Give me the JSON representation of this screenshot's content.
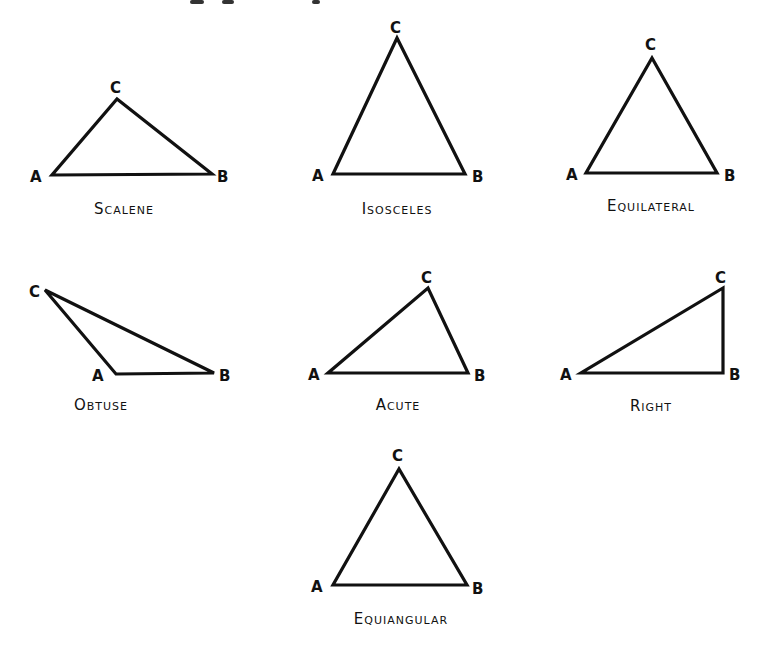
{
  "diagram": {
    "stroke_color": "#111111",
    "background": "#ffffff",
    "triangles": [
      {
        "name": "Scalene",
        "caption": "Scalene",
        "vertices": {
          "A": [
            52,
            175
          ],
          "B": [
            212,
            174
          ],
          "C": [
            117,
            99
          ]
        },
        "labels": {
          "A": "A",
          "B": "B",
          "C": "C"
        }
      },
      {
        "name": "Isosceles",
        "caption": "Isosceles",
        "vertices": {
          "A": [
            333,
            174
          ],
          "B": [
            465,
            174
          ],
          "C": [
            397,
            38
          ]
        },
        "labels": {
          "A": "A",
          "B": "B",
          "C": "C"
        }
      },
      {
        "name": "Equilateral",
        "caption": "Equilateral",
        "vertices": {
          "A": [
            586,
            173
          ],
          "B": [
            717,
            173
          ],
          "C": [
            652,
            58
          ]
        },
        "labels": {
          "A": "A",
          "B": "B",
          "C": "C"
        }
      },
      {
        "name": "Obtuse",
        "caption": "Obtuse",
        "vertices": {
          "A": [
            116,
            374
          ],
          "B": [
            214,
            373
          ],
          "C": [
            45,
            290
          ]
        },
        "labels": {
          "A": "A",
          "B": "B",
          "C": "C"
        }
      },
      {
        "name": "Acute",
        "caption": "Acute",
        "vertices": {
          "A": [
            328,
            373
          ],
          "B": [
            468,
            373
          ],
          "C": [
            428,
            288
          ]
        },
        "labels": {
          "A": "A",
          "B": "B",
          "C": "C"
        }
      },
      {
        "name": "Right",
        "caption": "Right",
        "vertices": {
          "A": [
            581,
            373
          ],
          "B": [
            723,
            373
          ],
          "C": [
            723,
            288
          ]
        },
        "labels": {
          "A": "A",
          "B": "B",
          "C": "C"
        }
      },
      {
        "name": "Equiangular",
        "caption": "Equiangular",
        "vertices": {
          "A": [
            333,
            585
          ],
          "B": [
            467,
            585
          ],
          "C": [
            399,
            469
          ]
        },
        "labels": {
          "A": "A",
          "B": "B",
          "C": "C"
        }
      }
    ]
  }
}
